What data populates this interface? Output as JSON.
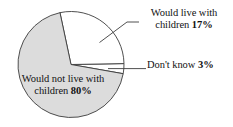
{
  "chart_data": {
    "type": "pie",
    "title": "",
    "subtitle": "",
    "xlabel": "",
    "ylabel": "",
    "grid": false,
    "legend_position": "none",
    "labels_inline": true,
    "units": "percent",
    "categories": [
      "Would live with children",
      "Don't know",
      "Would not live with children"
    ],
    "values": [
      17,
      3,
      80
    ],
    "slices": [
      {
        "name": "would-live-with-children",
        "label_line1": "Would live with",
        "label_line2": "children",
        "value": 17,
        "value_text": "17%",
        "fill": "#ffffff",
        "stroke": "#3c3c3c",
        "start_angle_deg": -12,
        "end_angle_deg": 89,
        "label_placement": "outside-top-right",
        "leader_line": true
      },
      {
        "name": "dont-know",
        "label_line1": "Don't know",
        "label_line2": "",
        "value": 3,
        "value_text": "3%",
        "fill": "#ffffff",
        "stroke": "#3c3c3c",
        "start_angle_deg": 89,
        "end_angle_deg": 100,
        "label_placement": "outside-right",
        "leader_line": true
      },
      {
        "name": "would-not-live-with-children",
        "label_line1": "Would not live with",
        "label_line2": "children",
        "value": 80,
        "value_text": "80%",
        "fill": "#dcdcdc",
        "stroke": "#3c3c3c",
        "start_angle_deg": 100,
        "end_angle_deg": 348,
        "label_placement": "inside",
        "leader_line": false
      }
    ],
    "geometry": {
      "center_x": 71,
      "center_y": 64.5,
      "radius": 53
    },
    "colors": {
      "background": "#ffffff",
      "slice_major": "#dcdcdc",
      "slice_minor": "#ffffff",
      "outline": "#3c3c3c",
      "leader": "#3c3c3c",
      "text": "#111111"
    }
  },
  "labels": {
    "live_with": {
      "line1": "Would live with",
      "line2_text": "children ",
      "line2_value": "17%"
    },
    "dont_know": {
      "text": "Don't know ",
      "value": "3%"
    },
    "not_live_with": {
      "line1": "Would not live with",
      "line2_text": "children ",
      "line2_value": "80%"
    }
  }
}
